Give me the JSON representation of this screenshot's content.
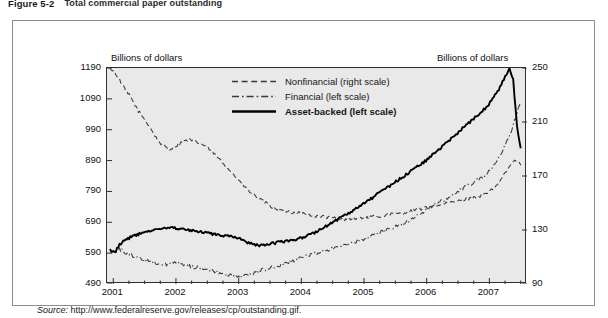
{
  "figure": {
    "number": "Figure 5-2",
    "title": "Total commercial paper outstanding",
    "source_label": "Source:",
    "source_url": "http://www.federalreserve.gov/releases/cp/outstanding.gif."
  },
  "axis_titles": {
    "left": "Billions of dollars",
    "right": "Billions of dollars"
  },
  "legend": [
    {
      "key": "dashed",
      "label": "Nonfinancial (right scale)",
      "bold": false
    },
    {
      "key": "dashdot",
      "label": "Financial (left scale)",
      "bold": false
    },
    {
      "key": "solid",
      "label": "Asset-backed (left scale)",
      "bold": true
    }
  ],
  "chart_data": {
    "type": "line",
    "title": "Total commercial paper outstanding",
    "xlabel": "",
    "ylabel": "Billions of dollars",
    "grid": false,
    "legend_position": "top-center",
    "xlim": [
      2000.9,
      2007.6
    ],
    "xticks": [
      "2001",
      "2002",
      "2003",
      "2004",
      "2005",
      "2006",
      "2007"
    ],
    "xtick_values": [
      2001,
      2002,
      2003,
      2004,
      2005,
      2006,
      2007
    ],
    "minor_ticks_per_year": 4,
    "y_left": {
      "label": "Billions of dollars",
      "ylim": [
        490,
        1190
      ],
      "ticks": [
        490,
        590,
        690,
        790,
        890,
        990,
        1090,
        1190
      ]
    },
    "y_right": {
      "label": "Billions of dollars",
      "ylim": [
        90,
        250
      ],
      "ticks": [
        90,
        130,
        170,
        210,
        250
      ]
    },
    "series": [
      {
        "name": "Nonfinancial (right scale)",
        "axis": "right",
        "style": "dashed",
        "color": "#3a3a3a",
        "x": [
          2000.95,
          2001.02,
          2001.08,
          2001.14,
          2001.2,
          2001.27,
          2001.33,
          2001.4,
          2001.47,
          2001.53,
          2001.6,
          2001.66,
          2001.72,
          2001.78,
          2001.85,
          2001.9,
          2001.96,
          2002.02,
          2002.08,
          2002.14,
          2002.2,
          2002.27,
          2002.33,
          2002.4,
          2002.47,
          2002.53,
          2002.6,
          2002.66,
          2002.72,
          2002.78,
          2002.85,
          2002.9,
          2002.96,
          2003.02,
          2003.08,
          2003.14,
          2003.2,
          2003.27,
          2003.33,
          2003.4,
          2003.47,
          2003.53,
          2003.6,
          2003.66,
          2003.72,
          2003.78,
          2003.85,
          2003.9,
          2003.96,
          2004.05,
          2004.15,
          2004.25,
          2004.35,
          2004.45,
          2004.55,
          2004.65,
          2004.75,
          2004.85,
          2004.95,
          2005.05,
          2005.15,
          2005.25,
          2005.35,
          2005.45,
          2005.55,
          2005.65,
          2005.75,
          2005.85,
          2005.95,
          2006.05,
          2006.15,
          2006.25,
          2006.35,
          2006.45,
          2006.55,
          2006.65,
          2006.75,
          2006.85,
          2006.95,
          2007.05,
          2007.15,
          2007.25,
          2007.35,
          2007.42,
          2007.5
        ],
        "values": [
          250,
          247,
          243,
          238,
          233,
          229,
          224,
          218,
          214,
          210,
          205,
          200,
          196,
          193,
          191,
          190,
          191,
          193,
          195,
          196,
          197,
          196,
          195,
          194,
          192,
          190,
          187,
          184,
          181,
          178,
          175,
          172,
          169,
          166,
          163,
          160,
          157,
          155,
          153,
          151,
          149,
          147,
          146,
          145,
          144,
          144,
          143,
          143,
          143,
          142,
          141,
          140,
          140,
          139,
          139,
          138,
          138,
          138,
          139,
          139,
          140,
          140,
          141,
          142,
          142,
          143,
          144,
          145,
          146,
          147,
          148,
          149,
          150,
          151,
          152,
          153,
          154,
          155,
          157,
          160,
          165,
          172,
          179,
          182,
          178
        ]
      },
      {
        "name": "Financial (left scale)",
        "axis": "left",
        "style": "dashdot",
        "color": "#3a3a3a",
        "x": [
          2000.95,
          2001.02,
          2001.08,
          2001.14,
          2001.2,
          2001.27,
          2001.33,
          2001.4,
          2001.47,
          2001.53,
          2001.6,
          2001.66,
          2001.72,
          2001.78,
          2001.85,
          2001.9,
          2001.96,
          2002.02,
          2002.08,
          2002.14,
          2002.2,
          2002.27,
          2002.33,
          2002.4,
          2002.47,
          2002.53,
          2002.6,
          2002.66,
          2002.72,
          2002.78,
          2002.85,
          2002.9,
          2002.96,
          2003.02,
          2003.08,
          2003.14,
          2003.2,
          2003.27,
          2003.33,
          2003.4,
          2003.47,
          2003.53,
          2003.6,
          2003.66,
          2003.72,
          2003.78,
          2003.85,
          2003.9,
          2003.96,
          2004.05,
          2004.15,
          2004.25,
          2004.35,
          2004.45,
          2004.55,
          2004.65,
          2004.75,
          2004.85,
          2004.95,
          2005.05,
          2005.15,
          2005.25,
          2005.35,
          2005.45,
          2005.55,
          2005.65,
          2005.75,
          2005.85,
          2005.95,
          2006.05,
          2006.15,
          2006.25,
          2006.35,
          2006.45,
          2006.55,
          2006.65,
          2006.75,
          2006.85,
          2006.95,
          2007.05,
          2007.15,
          2007.25,
          2007.35,
          2007.42,
          2007.5
        ],
        "values": [
          600,
          592,
          605,
          598,
          590,
          586,
          580,
          574,
          570,
          566,
          562,
          560,
          558,
          556,
          554,
          556,
          558,
          560,
          556,
          552,
          548,
          546,
          544,
          542,
          540,
          536,
          532,
          528,
          524,
          520,
          518,
          516,
          514,
          512,
          516,
          520,
          524,
          528,
          532,
          536,
          540,
          544,
          548,
          552,
          556,
          560,
          564,
          568,
          572,
          578,
          584,
          590,
          596,
          602,
          608,
          614,
          620,
          626,
          632,
          640,
          648,
          656,
          664,
          672,
          680,
          690,
          700,
          712,
          724,
          736,
          748,
          760,
          772,
          784,
          796,
          808,
          820,
          832,
          846,
          870,
          900,
          940,
          985,
          1030,
          1080
        ]
      },
      {
        "name": "Asset-backed (left scale)",
        "axis": "left",
        "style": "solid",
        "color": "#000000",
        "x": [
          2000.95,
          2001.02,
          2001.08,
          2001.14,
          2001.2,
          2001.27,
          2001.33,
          2001.4,
          2001.47,
          2001.53,
          2001.6,
          2001.66,
          2001.72,
          2001.78,
          2001.85,
          2001.9,
          2001.96,
          2002.02,
          2002.08,
          2002.14,
          2002.2,
          2002.27,
          2002.33,
          2002.4,
          2002.47,
          2002.53,
          2002.6,
          2002.66,
          2002.72,
          2002.78,
          2002.85,
          2002.9,
          2002.96,
          2003.02,
          2003.08,
          2003.14,
          2003.2,
          2003.27,
          2003.33,
          2003.4,
          2003.47,
          2003.53,
          2003.6,
          2003.66,
          2003.72,
          2003.78,
          2003.85,
          2003.9,
          2003.96,
          2004.05,
          2004.15,
          2004.25,
          2004.35,
          2004.45,
          2004.55,
          2004.65,
          2004.75,
          2004.85,
          2004.95,
          2005.05,
          2005.15,
          2005.25,
          2005.35,
          2005.45,
          2005.55,
          2005.65,
          2005.75,
          2005.85,
          2005.95,
          2006.05,
          2006.15,
          2006.25,
          2006.35,
          2006.45,
          2006.55,
          2006.65,
          2006.75,
          2006.85,
          2006.95,
          2007.05,
          2007.15,
          2007.25,
          2007.32,
          2007.38,
          2007.44,
          2007.5
        ],
        "values": [
          600,
          590,
          612,
          625,
          632,
          640,
          646,
          652,
          656,
          660,
          662,
          664,
          666,
          668,
          670,
          672,
          672,
          670,
          668,
          666,
          664,
          662,
          660,
          658,
          656,
          654,
          652,
          650,
          648,
          646,
          644,
          642,
          640,
          636,
          630,
          624,
          620,
          618,
          616,
          618,
          620,
          622,
          624,
          626,
          628,
          630,
          632,
          634,
          636,
          642,
          650,
          660,
          672,
          684,
          696,
          708,
          720,
          732,
          744,
          758,
          772,
          786,
          800,
          814,
          828,
          842,
          856,
          870,
          884,
          900,
          918,
          936,
          954,
          972,
          990,
          1008,
          1026,
          1044,
          1062,
          1090,
          1120,
          1160,
          1190,
          1150,
          1000,
          930
        ]
      }
    ],
    "annotations": [
      {
        "text": "Asset-backed peak late 2007 then sharp decline",
        "x": 2007.3,
        "y": 1190
      }
    ]
  },
  "ticks": {
    "left": [
      "1190",
      "1090",
      "990",
      "890",
      "790",
      "690",
      "590",
      "490"
    ],
    "right": [
      "250",
      "210",
      "170",
      "130",
      "90"
    ],
    "bottom": [
      "2001",
      "2002",
      "2003",
      "2004",
      "2005",
      "2006",
      "2007"
    ]
  }
}
